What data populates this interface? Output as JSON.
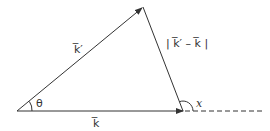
{
  "diagram": {
    "type": "vector-triangle",
    "colors": {
      "stroke": "#333333",
      "background": "#ffffff"
    },
    "vertices": {
      "origin": [
        17,
        111
      ],
      "top": [
        143,
        7
      ],
      "right": [
        183,
        111
      ]
    },
    "vectors": [
      {
        "id": "k-prime",
        "label": "k̅′",
        "from": "origin",
        "to": "top"
      },
      {
        "id": "k",
        "label": "k̅",
        "from": "origin",
        "to": "right"
      },
      {
        "id": "k-diff",
        "label": "| k̅′ – k̅ |",
        "from": "top",
        "to": "right"
      }
    ],
    "angles": [
      {
        "id": "theta",
        "label": "θ",
        "at": "origin"
      },
      {
        "id": "chi",
        "label": "x",
        "at": "right"
      }
    ],
    "extension": {
      "style": "dashed",
      "from": [
        183,
        111
      ],
      "to": [
        263,
        111
      ]
    }
  }
}
